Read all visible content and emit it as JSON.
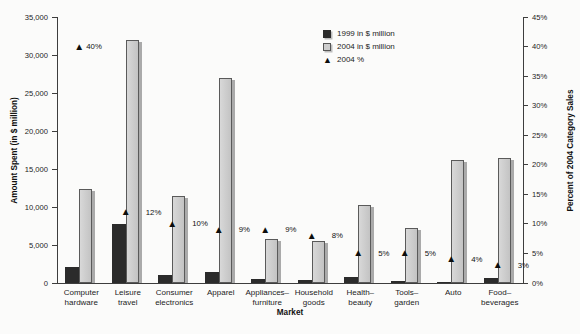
{
  "chart_data": {
    "type": "bar",
    "title": "",
    "xlabel": "Market",
    "legend_position": "top-center",
    "grid": false,
    "left_axis": {
      "label": "Amount Spent (in $ million)",
      "max": 35000,
      "ticks": [
        {
          "value": 0,
          "label": "0"
        },
        {
          "value": 5000,
          "label": "5,000"
        },
        {
          "value": 10000,
          "label": "10,000"
        },
        {
          "value": 15000,
          "label": "15,000"
        },
        {
          "value": 20000,
          "label": "20,000"
        },
        {
          "value": 25000,
          "label": "25,000"
        },
        {
          "value": 30000,
          "label": "30,000"
        },
        {
          "value": 35000,
          "label": "35,000"
        }
      ]
    },
    "right_axis": {
      "label": "Percent of 2004 Category Sales",
      "max": 45,
      "ticks": [
        {
          "value": 0,
          "label": "0%"
        },
        {
          "value": 5,
          "label": "5%"
        },
        {
          "value": 10,
          "label": "10%"
        },
        {
          "value": 15,
          "label": "15%"
        },
        {
          "value": 20,
          "label": "20%"
        },
        {
          "value": 25,
          "label": "25%"
        },
        {
          "value": 30,
          "label": "30%"
        },
        {
          "value": 35,
          "label": "35%"
        },
        {
          "value": 40,
          "label": "40%"
        },
        {
          "value": 45,
          "label": "45%"
        }
      ]
    },
    "categories": [
      {
        "label": "Computer hardware",
        "lines": [
          "Computer",
          "hardware"
        ]
      },
      {
        "label": "Leisure travel",
        "lines": [
          "Leisure",
          "travel"
        ]
      },
      {
        "label": "Consumer electronics",
        "lines": [
          "Consumer",
          "electronics"
        ]
      },
      {
        "label": "Apparel",
        "lines": [
          "Apparel"
        ]
      },
      {
        "label": "Appliances–furniture",
        "lines": [
          "Appliances–",
          "furniture"
        ]
      },
      {
        "label": "Household goods",
        "lines": [
          "Household",
          "goods"
        ]
      },
      {
        "label": "Health–beauty",
        "lines": [
          "Health–",
          "beauty"
        ]
      },
      {
        "label": "Tools–garden",
        "lines": [
          "Tools–",
          "garden"
        ]
      },
      {
        "label": "Auto",
        "lines": [
          "Auto"
        ]
      },
      {
        "label": "Food–beverages",
        "lines": [
          "Food–",
          "beverages"
        ]
      }
    ],
    "series": [
      {
        "name": "1999 in $ million",
        "type": "bar",
        "axis": "left",
        "color": "#2b2b2b",
        "values": [
          2100,
          7800,
          1100,
          1500,
          500,
          400,
          750,
          300,
          100,
          600
        ]
      },
      {
        "name": "2004 in $ million",
        "type": "bar",
        "axis": "left",
        "color": "#cccccc",
        "values": [
          12400,
          32000,
          11500,
          27000,
          5800,
          5500,
          10200,
          7200,
          16200,
          16500
        ]
      },
      {
        "name": "2004 %",
        "type": "marker",
        "axis": "right",
        "marker": "triangle-up",
        "color": "#111111",
        "values": [
          40,
          12,
          10,
          9,
          9,
          8,
          5,
          5,
          4,
          3
        ],
        "labels": [
          "40%",
          "12%",
          "10%",
          "9%",
          "9%",
          "8%",
          "5%",
          "5%",
          "4%",
          "3%"
        ]
      }
    ]
  }
}
